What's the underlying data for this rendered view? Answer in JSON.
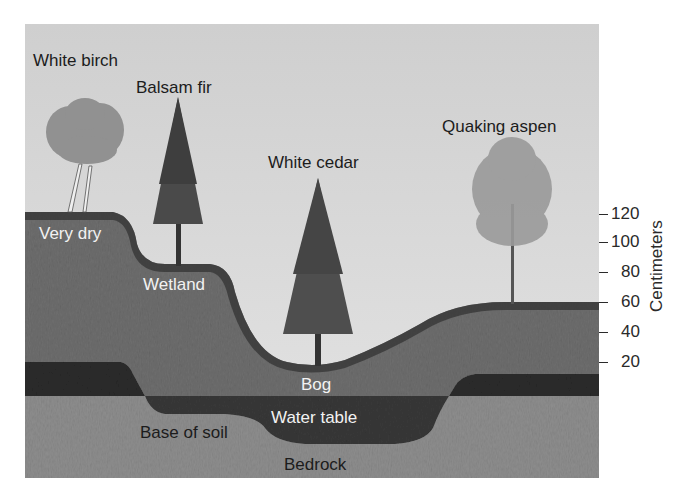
{
  "diagram": {
    "type": "soil-profile-cross-section",
    "trees": [
      {
        "label": "White birch"
      },
      {
        "label": "Balsam fir"
      },
      {
        "label": "White cedar"
      },
      {
        "label": "Quaking aspen"
      }
    ],
    "zones": [
      {
        "label": "Very dry"
      },
      {
        "label": "Wetland"
      },
      {
        "label": "Bog"
      }
    ],
    "layers": [
      {
        "label": "Water table"
      },
      {
        "label": "Base of soil"
      },
      {
        "label": "Bedrock"
      }
    ],
    "scale": {
      "title": "Centimeters",
      "ticks": [
        "120",
        "100",
        "80",
        "60",
        "40",
        "20"
      ]
    }
  }
}
